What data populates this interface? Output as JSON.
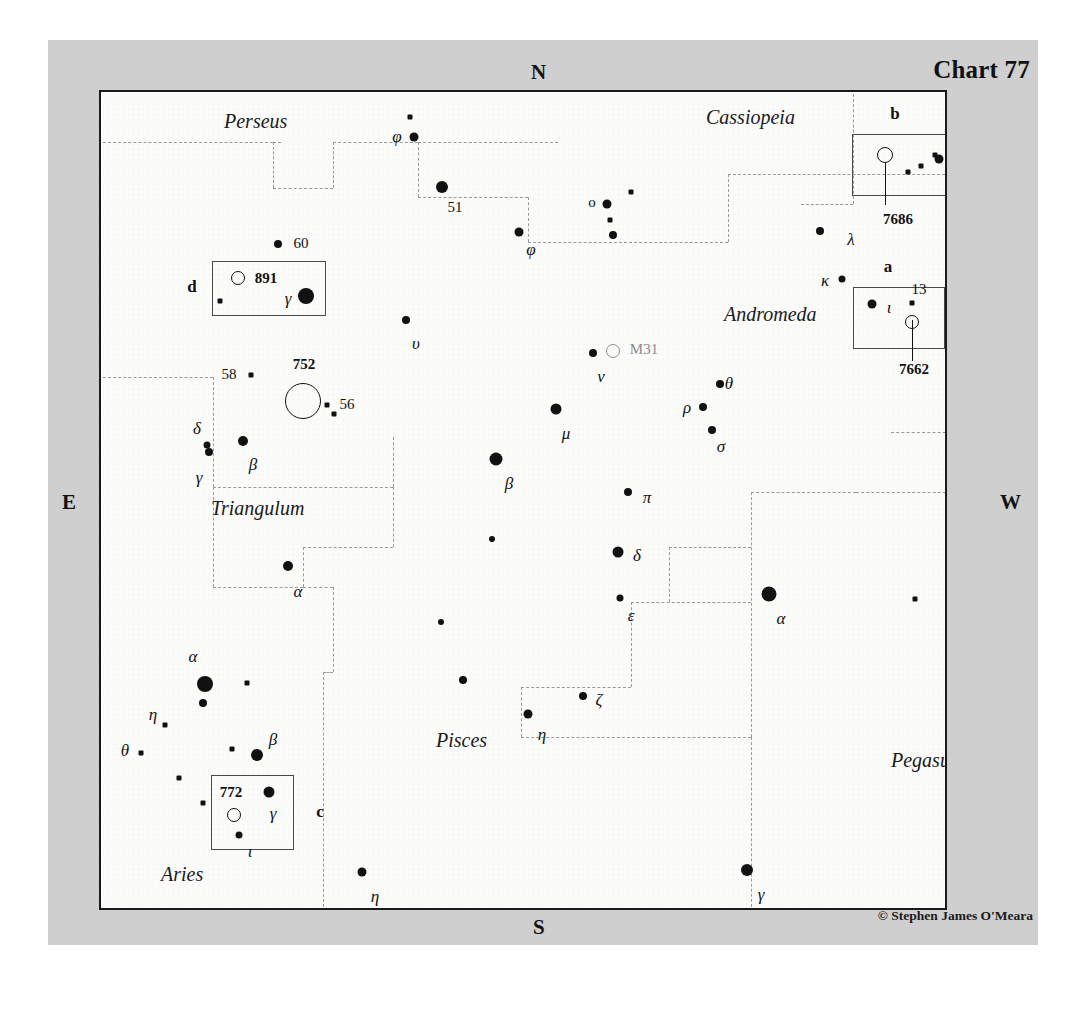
{
  "chart": {
    "title": "Chart 77",
    "credit": "© Stephen James O'Meara",
    "compass": {
      "n": "N",
      "s": "S",
      "e": "E",
      "w": "W"
    }
  },
  "constellations": [
    {
      "name": "Perseus",
      "x": 123,
      "y": 29
    },
    {
      "name": "Cassiopeia",
      "x": 605,
      "y": 25
    },
    {
      "name": "Andromeda",
      "x": 623,
      "y": 222
    },
    {
      "name": "Triangulum",
      "x": 110,
      "y": 416
    },
    {
      "name": "Pisces",
      "x": 335,
      "y": 648
    },
    {
      "name": "Pegasus",
      "x": 790,
      "y": 668
    },
    {
      "name": "Aries",
      "x": 60,
      "y": 782
    }
  ],
  "stars": [
    {
      "name": "phi-and-upper",
      "x": 309,
      "y": 25,
      "size": 5,
      "shape": "sq"
    },
    {
      "name": "phi-and",
      "x": 313,
      "y": 45,
      "size": 9,
      "label": "φ",
      "lx": 296,
      "ly": 45
    },
    {
      "name": "star-51-and",
      "x": 341,
      "y": 95,
      "size": 12,
      "label": "51",
      "lx": 354,
      "ly": 115,
      "labeltype": "num"
    },
    {
      "name": "phi-psc",
      "x": 418,
      "y": 140,
      "size": 9,
      "label": "φ",
      "lx": 430,
      "ly": 158
    },
    {
      "name": "omicron-and",
      "x": 506,
      "y": 112,
      "size": 9,
      "label": "ο",
      "lx": 491,
      "ly": 110,
      "labeltype": "num"
    },
    {
      "name": "star-near-o-1",
      "x": 509,
      "y": 128,
      "size": 5,
      "shape": "sq"
    },
    {
      "name": "star-near-o-2",
      "x": 512,
      "y": 143,
      "size": 8
    },
    {
      "name": "star-cas-sq",
      "x": 530,
      "y": 100,
      "size": 5,
      "shape": "sq"
    },
    {
      "name": "lambda-and",
      "x": 719,
      "y": 139,
      "size": 8,
      "label": "λ",
      "lx": 750,
      "ly": 148
    },
    {
      "name": "kappa-and",
      "x": 741,
      "y": 187,
      "size": 7,
      "label": "κ",
      "lx": 724,
      "ly": 189
    },
    {
      "name": "star-60-and",
      "x": 177,
      "y": 152,
      "size": 8,
      "label": "60",
      "lx": 200,
      "ly": 151,
      "labeltype": "num"
    },
    {
      "name": "upsilon-and",
      "x": 305,
      "y": 228,
      "size": 8,
      "label": "υ",
      "lx": 315,
      "ly": 252
    },
    {
      "name": "nu-and",
      "x": 492,
      "y": 261,
      "size": 8,
      "label": "ν",
      "lx": 500,
      "ly": 285
    },
    {
      "name": "mu-and",
      "x": 455,
      "y": 317,
      "size": 11,
      "label": "μ",
      "lx": 465,
      "ly": 342
    },
    {
      "name": "theta-and",
      "x": 619,
      "y": 292,
      "size": 8,
      "label": "θ",
      "lx": 628,
      "ly": 292
    },
    {
      "name": "rho-and",
      "x": 602,
      "y": 315,
      "size": 8,
      "label": "ρ",
      "lx": 586,
      "ly": 316
    },
    {
      "name": "sigma-and",
      "x": 611,
      "y": 338,
      "size": 8,
      "label": "σ",
      "lx": 620,
      "ly": 355
    },
    {
      "name": "pi-and",
      "x": 527,
      "y": 400,
      "size": 8,
      "label": "π",
      "lx": 546,
      "ly": 406
    },
    {
      "name": "delta-and",
      "x": 517,
      "y": 460,
      "size": 11,
      "label": "δ",
      "lx": 536,
      "ly": 464
    },
    {
      "name": "epsilon-and",
      "x": 519,
      "y": 506,
      "size": 7,
      "label": "ε",
      "lx": 530,
      "ly": 524
    },
    {
      "name": "alpha-and",
      "x": 668,
      "y": 502,
      "size": 15,
      "label": "α",
      "lx": 680,
      "ly": 527
    },
    {
      "name": "beta-psc",
      "x": 395,
      "y": 367,
      "size": 13,
      "label": "β",
      "lx": 408,
      "ly": 392
    },
    {
      "name": "star-58-tri",
      "x": 150,
      "y": 283,
      "size": 5,
      "shape": "sq",
      "label": "58",
      "lx": 128,
      "ly": 282,
      "labeltype": "num"
    },
    {
      "name": "star-56-near",
      "x": 226,
      "y": 313,
      "size": 5,
      "shape": "sq"
    },
    {
      "name": "star-56",
      "x": 233,
      "y": 322,
      "size": 5,
      "shape": "sq",
      "label": "56",
      "lx": 246,
      "ly": 312,
      "labeltype": "num"
    },
    {
      "name": "delta-tri",
      "x": 106,
      "y": 353,
      "size": 7,
      "label": "δ",
      "lx": 96,
      "ly": 337
    },
    {
      "name": "gamma-tri",
      "x": 108,
      "y": 360,
      "size": 8,
      "label": "γ",
      "lx": 98,
      "ly": 386
    },
    {
      "name": "beta-tri",
      "x": 142,
      "y": 349,
      "size": 10,
      "label": "β",
      "lx": 152,
      "ly": 373
    },
    {
      "name": "alpha-tri",
      "x": 187,
      "y": 474,
      "size": 10,
      "label": "α",
      "lx": 197,
      "ly": 500
    },
    {
      "name": "alpha-ari",
      "x": 104,
      "y": 592,
      "size": 16,
      "label": "α",
      "lx": 92,
      "ly": 565
    },
    {
      "name": "alpha-ari-low",
      "x": 102,
      "y": 611,
      "size": 8
    },
    {
      "name": "eta-ari",
      "x": 64,
      "y": 633,
      "size": 5,
      "shape": "sq",
      "label": "η",
      "lx": 52,
      "ly": 623
    },
    {
      "name": "theta-ari",
      "x": 40,
      "y": 661,
      "size": 5,
      "shape": "sq",
      "label": "θ",
      "lx": 24,
      "ly": 659
    },
    {
      "name": "star-ari-1",
      "x": 146,
      "y": 591,
      "size": 5,
      "shape": "sq"
    },
    {
      "name": "star-ari-2",
      "x": 131,
      "y": 657,
      "size": 5,
      "shape": "sq"
    },
    {
      "name": "star-ari-3",
      "x": 78,
      "y": 686,
      "size": 5,
      "shape": "sq"
    },
    {
      "name": "beta-ari",
      "x": 156,
      "y": 663,
      "size": 12,
      "label": "β",
      "lx": 172,
      "ly": 648
    },
    {
      "name": "star-ari-4",
      "x": 102,
      "y": 711,
      "size": 5,
      "shape": "sq"
    },
    {
      "name": "eta-psc",
      "x": 427,
      "y": 622,
      "size": 9,
      "label": "η",
      "lx": 441,
      "ly": 643
    },
    {
      "name": "zeta-psc",
      "x": 482,
      "y": 604,
      "size": 8,
      "label": "ζ",
      "lx": 498,
      "ly": 608
    },
    {
      "name": "star-psc-1",
      "x": 391,
      "y": 447,
      "size": 6
    },
    {
      "name": "star-psc-2",
      "x": 340,
      "y": 530,
      "size": 6
    },
    {
      "name": "star-psc-3",
      "x": 362,
      "y": 588,
      "size": 8
    },
    {
      "name": "eta-psc-south",
      "x": 261,
      "y": 780,
      "size": 9,
      "label": "η",
      "lx": 274,
      "ly": 805
    },
    {
      "name": "gamma-peg",
      "x": 646,
      "y": 778,
      "size": 12,
      "label": "γ",
      "lx": 660,
      "ly": 803
    },
    {
      "name": "star-peg-sq",
      "x": 814,
      "y": 507,
      "size": 5,
      "shape": "sq"
    },
    {
      "name": "star-cas-edge",
      "x": 834,
      "y": 63,
      "size": 5,
      "shape": "sq"
    }
  ],
  "deep_sky": [
    {
      "name": "m31",
      "label": "M31",
      "x": 512,
      "y": 259,
      "r": 6,
      "style": "gal",
      "lx": 543,
      "ly": 257
    },
    {
      "name": "ngc752",
      "label": "752",
      "x": 202,
      "y": 309,
      "r": 17,
      "style": "cluster",
      "lx": 203,
      "ly": 272
    }
  ],
  "insets": [
    {
      "name": "inset-b",
      "letter": "b",
      "letter_x": 794,
      "letter_y": 22,
      "box": {
        "x": 751,
        "y": 42,
        "w": 117,
        "h": 60
      },
      "dso_label": "7686",
      "dso_label_x": 797,
      "dso_label_y": 127,
      "leader": {
        "x": 784,
        "y": 70,
        "h": 43
      },
      "objects": [
        {
          "kind": "open",
          "x": 784,
          "y": 63,
          "r": 7
        },
        {
          "kind": "star",
          "x": 820,
          "y": 74,
          "size": 5,
          "shape": "sq"
        },
        {
          "kind": "star",
          "x": 807,
          "y": 80,
          "size": 5,
          "shape": "sq"
        },
        {
          "kind": "star",
          "x": 838,
          "y": 67,
          "size": 9,
          "label": "8",
          "lx": 850,
          "ly": 82
        },
        {
          "kind": "star",
          "x": 869,
          "y": 38,
          "size": 8,
          "label": "7",
          "lx": 883,
          "ly": 50
        }
      ]
    },
    {
      "name": "inset-a",
      "letter": "a",
      "letter_x": 787,
      "letter_y": 175,
      "box": {
        "x": 752,
        "y": 195,
        "w": 90,
        "h": 60
      },
      "dso_label": "7662",
      "dso_label_x": 813,
      "dso_label_y": 277,
      "leader": {
        "x": 811,
        "y": 228,
        "h": 41
      },
      "objects": [
        {
          "kind": "star",
          "x": 771,
          "y": 212,
          "size": 9,
          "label": "ι",
          "lx": 788,
          "ly": 216
        },
        {
          "kind": "star",
          "x": 811,
          "y": 211,
          "size": 5,
          "shape": "sq",
          "label": "13",
          "lx": 818,
          "ly": 197,
          "labeltype": "num"
        },
        {
          "kind": "open",
          "x": 811,
          "y": 230,
          "r": 6
        }
      ]
    },
    {
      "name": "inset-d",
      "letter": "d",
      "letter_x": 91,
      "letter_y": 195,
      "box": {
        "x": 111,
        "y": 169,
        "w": 112,
        "h": 53
      },
      "dso_label": "891",
      "dso_label_x": 165,
      "dso_label_y": 186,
      "objects": [
        {
          "kind": "open",
          "x": 137,
          "y": 186,
          "r": 6
        },
        {
          "kind": "star",
          "x": 119,
          "y": 209,
          "size": 5,
          "shape": "sq"
        },
        {
          "kind": "star",
          "x": 205,
          "y": 204,
          "size": 16,
          "label": "γ",
          "lx": 187,
          "ly": 207
        }
      ]
    },
    {
      "name": "inset-c",
      "letter": "c",
      "letter_x": 219,
      "letter_y": 720,
      "box": {
        "x": 110,
        "y": 683,
        "w": 81,
        "h": 73
      },
      "dso_label": "772",
      "dso_label_x": 130,
      "dso_label_y": 700,
      "objects": [
        {
          "kind": "star",
          "x": 168,
          "y": 700,
          "size": 11,
          "label": "γ",
          "lx": 172,
          "ly": 722
        },
        {
          "kind": "open",
          "x": 133,
          "y": 723,
          "r": 6
        },
        {
          "kind": "star",
          "x": 138,
          "y": 743,
          "size": 7,
          "label": "ι",
          "lx": 149,
          "ly": 760
        }
      ]
    }
  ],
  "boundaries": {
    "note": "dashed constellation boundary lines",
    "segments": [
      {
        "type": "h",
        "x": 2,
        "y": 50,
        "len": 170
      },
      {
        "type": "h",
        "x": 172,
        "y": 50,
        "len": 8
      },
      {
        "type": "v",
        "x": 172,
        "y": 50,
        "len": 46
      },
      {
        "type": "h",
        "x": 172,
        "y": 96,
        "len": 60
      },
      {
        "type": "v",
        "x": 232,
        "y": 50,
        "len": 46
      },
      {
        "type": "h",
        "x": 232,
        "y": 50,
        "len": 85
      },
      {
        "type": "v",
        "x": 317,
        "y": 50,
        "len": 0
      },
      {
        "type": "h",
        "x": 317,
        "y": 50,
        "len": 140
      },
      {
        "type": "v",
        "x": 317,
        "y": 50,
        "len": 55
      },
      {
        "type": "h",
        "x": 317,
        "y": 105,
        "len": 110
      },
      {
        "type": "v",
        "x": 427,
        "y": 105,
        "len": 45
      },
      {
        "type": "h",
        "x": 427,
        "y": 150,
        "len": 200
      },
      {
        "type": "v",
        "x": 627,
        "y": 82,
        "len": 68
      },
      {
        "type": "h",
        "x": 627,
        "y": 82,
        "len": 222
      },
      {
        "type": "h",
        "x": 2,
        "y": 285,
        "len": 110
      },
      {
        "type": "v",
        "x": 112,
        "y": 285,
        "len": 110
      },
      {
        "type": "h",
        "x": 112,
        "y": 395,
        "len": 180
      },
      {
        "type": "v",
        "x": 292,
        "y": 345,
        "len": 50
      },
      {
        "type": "h",
        "x": 292,
        "y": 345,
        "len": 0
      },
      {
        "type": "v",
        "x": 112,
        "y": 395,
        "len": 100
      },
      {
        "type": "h",
        "x": 112,
        "y": 495,
        "len": 90
      },
      {
        "type": "v",
        "x": 202,
        "y": 455,
        "len": 40
      },
      {
        "type": "h",
        "x": 202,
        "y": 455,
        "len": 90
      },
      {
        "type": "v",
        "x": 292,
        "y": 395,
        "len": 60
      },
      {
        "type": "h",
        "x": 202,
        "y": 495,
        "len": 30
      },
      {
        "type": "v",
        "x": 232,
        "y": 495,
        "len": 85
      },
      {
        "type": "h",
        "x": 232,
        "y": 580,
        "len": 0
      },
      {
        "type": "v",
        "x": 222,
        "y": 580,
        "len": 240
      },
      {
        "type": "h",
        "x": 222,
        "y": 580,
        "len": 10
      },
      {
        "type": "h",
        "x": 420,
        "y": 595,
        "len": 110
      },
      {
        "type": "v",
        "x": 420,
        "y": 595,
        "len": 50
      },
      {
        "type": "h",
        "x": 420,
        "y": 645,
        "len": 230
      },
      {
        "type": "v",
        "x": 530,
        "y": 510,
        "len": 85
      },
      {
        "type": "h",
        "x": 530,
        "y": 510,
        "len": 120
      },
      {
        "type": "v",
        "x": 650,
        "y": 400,
        "len": 245
      },
      {
        "type": "h",
        "x": 650,
        "y": 400,
        "len": 0
      },
      {
        "type": "v",
        "x": 650,
        "y": 645,
        "len": 175
      },
      {
        "type": "h",
        "x": 650,
        "y": 400,
        "len": 0
      },
      {
        "type": "v",
        "x": 568,
        "y": 455,
        "len": 55
      },
      {
        "type": "h",
        "x": 568,
        "y": 455,
        "len": 82
      },
      {
        "type": "h",
        "x": 650,
        "y": 400,
        "len": 105
      },
      {
        "type": "v",
        "x": 755,
        "y": 400,
        "len": 0
      },
      {
        "type": "h",
        "x": 755,
        "y": 400,
        "len": 95
      },
      {
        "type": "v",
        "x": 850,
        "y": 340,
        "len": 60
      },
      {
        "type": "h",
        "x": 790,
        "y": 340,
        "len": 60
      },
      {
        "type": "v",
        "x": 790,
        "y": 340,
        "len": 0
      },
      {
        "type": "v",
        "x": 655,
        "y": 55,
        "len": 0
      },
      {
        "type": "v",
        "x": 752,
        "y": 2,
        "len": 110
      },
      {
        "type": "h",
        "x": 700,
        "y": 112,
        "len": 52
      }
    ]
  }
}
